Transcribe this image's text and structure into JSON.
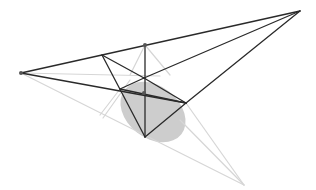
{
  "diagram": {
    "width": 316,
    "height": 190,
    "background": "#ffffff",
    "colors": {
      "dark_line": "#2a2a2a",
      "light_line": "#d6d6d6",
      "ellipse_fill": "#cdcdcd",
      "point": "#555555"
    },
    "ellipse": {
      "cx": 153,
      "cy": 112,
      "rx": 36,
      "ry": 26,
      "rotate": 38
    },
    "points": {
      "left_vanishing": [
        21,
        73
      ],
      "right_vanishing": [
        300,
        11
      ],
      "bottom_vanishing": [
        244,
        185
      ],
      "A": [
        102,
        55
      ],
      "B": [
        145,
        45
      ],
      "C": [
        144,
        78
      ],
      "D": [
        120,
        89
      ],
      "E": [
        186,
        103
      ],
      "F": [
        145,
        137
      ],
      "center": [
        144,
        93
      ]
    },
    "dark_segments": [
      [
        [
          21,
          73
        ],
        [
          300,
          11
        ]
      ],
      [
        [
          21,
          73
        ],
        [
          186,
          103
        ]
      ],
      [
        [
          102,
          55
        ],
        [
          144,
          78
        ]
      ],
      [
        [
          102,
          55
        ],
        [
          145,
          137
        ]
      ],
      [
        [
          145,
          45
        ],
        [
          145,
          137
        ]
      ],
      [
        [
          144,
          78
        ],
        [
          300,
          11
        ]
      ],
      [
        [
          144,
          78
        ],
        [
          120,
          89
        ]
      ],
      [
        [
          120,
          89
        ],
        [
          186,
          103
        ]
      ],
      [
        [
          186,
          103
        ],
        [
          145,
          137
        ]
      ],
      [
        [
          144,
          78
        ],
        [
          186,
          103
        ]
      ],
      [
        [
          186,
          103
        ],
        [
          300,
          11
        ]
      ]
    ],
    "light_segments": [
      [
        [
          21,
          73
        ],
        [
          244,
          185
        ]
      ],
      [
        [
          244,
          185
        ],
        [
          180,
          120
        ]
      ],
      [
        [
          145,
          45
        ],
        [
          170,
          75
        ]
      ],
      [
        [
          103,
          118
        ],
        [
          130,
          80
        ]
      ],
      [
        [
          21,
          73
        ],
        [
          160,
          76
        ]
      ],
      [
        [
          120,
          89
        ],
        [
          100,
          115
        ]
      ],
      [
        [
          145,
          45
        ],
        [
          130,
          75
        ]
      ],
      [
        [
          186,
          103
        ],
        [
          244,
          185
        ]
      ]
    ],
    "dots": [
      [
        21,
        73
      ],
      [
        145,
        45
      ],
      [
        144,
        93
      ]
    ]
  }
}
